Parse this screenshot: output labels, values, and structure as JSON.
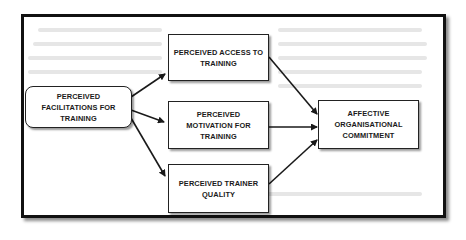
{
  "diagram": {
    "type": "flow",
    "nodes": {
      "facilitations": {
        "label": "PERCEIVED\nFACILITATIONS FOR\nTRAINING"
      },
      "access": {
        "label": "PERCEIVED ACCESS TO\nTRAINING"
      },
      "motivation": {
        "label": "PERCEIVED\nMOTIVATION FOR\nTRAINING"
      },
      "trainer": {
        "label": "PERCEIVED TRAINER\nQUALITY"
      },
      "commitment": {
        "label": "AFFECTIVE\nORGANISATIONAL\nCOMMITMENT"
      }
    },
    "edges": [
      {
        "from": "facilitations",
        "to": "access"
      },
      {
        "from": "facilitations",
        "to": "motivation"
      },
      {
        "from": "facilitations",
        "to": "trainer"
      },
      {
        "from": "access",
        "to": "commitment"
      },
      {
        "from": "motivation",
        "to": "commitment"
      },
      {
        "from": "trainer",
        "to": "commitment"
      }
    ],
    "colors": {
      "stroke": "#1a1a1a",
      "box_fill": "#ffffff",
      "background": "#ffffff"
    }
  }
}
